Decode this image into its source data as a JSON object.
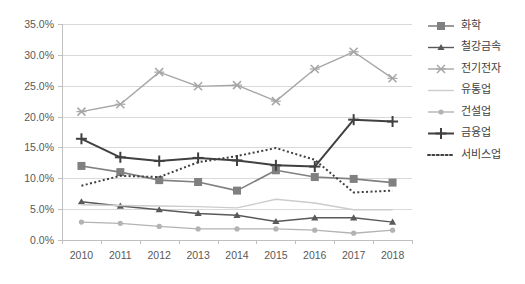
{
  "chart_data": {
    "type": "line",
    "title": "",
    "subtitle": "",
    "xlabel": "",
    "ylabel": "",
    "grid": true,
    "legend_position": "right",
    "categories": [
      "2010",
      "2011",
      "2012",
      "2013",
      "2014",
      "2015",
      "2016",
      "2017",
      "2018"
    ],
    "x": [
      2010,
      2011,
      2012,
      2013,
      2014,
      2015,
      2016,
      2017,
      2018
    ],
    "ylim": [
      0,
      35
    ],
    "ytick_labels": [
      "0.0%",
      "5.0%",
      "10.0%",
      "15.0%",
      "20.0%",
      "25.0%",
      "30.0%",
      "35.0%"
    ],
    "ytick_values": [
      0,
      5,
      10,
      15,
      20,
      25,
      30,
      35
    ],
    "yunit": "%",
    "series": [
      {
        "name": "화학",
        "marker": "square",
        "color": "#808080",
        "dash": "none",
        "width": 1.6,
        "values": [
          12.0,
          11.0,
          9.7,
          9.4,
          8.0,
          11.3,
          10.2,
          9.9,
          9.3
        ]
      },
      {
        "name": "철강금속",
        "marker": "triangle",
        "color": "#595959",
        "dash": "none",
        "width": 1.4,
        "values": [
          6.2,
          5.5,
          4.9,
          4.3,
          4.0,
          3.0,
          3.6,
          3.6,
          2.9
        ]
      },
      {
        "name": "전기전자",
        "marker": "x",
        "color": "#a6a6a6",
        "dash": "none",
        "width": 1.4,
        "values": [
          20.8,
          22.0,
          27.2,
          24.9,
          25.1,
          22.5,
          27.7,
          30.5,
          26.2
        ]
      },
      {
        "name": "유통업",
        "marker": "none",
        "color": "#cccccc",
        "dash": "none",
        "width": 1.4,
        "values": [
          5.7,
          5.6,
          5.5,
          5.4,
          5.2,
          6.6,
          6.0,
          4.9,
          4.9
        ]
      },
      {
        "name": "건설업",
        "marker": "dot",
        "color": "#b3b3b3",
        "dash": "none",
        "width": 1.4,
        "values": [
          2.9,
          2.7,
          2.2,
          1.8,
          1.8,
          1.8,
          1.6,
          1.1,
          1.6
        ]
      },
      {
        "name": "금융업",
        "marker": "plus",
        "color": "#404040",
        "dash": "none",
        "width": 2.0,
        "values": [
          16.4,
          13.4,
          12.8,
          13.3,
          12.9,
          12.1,
          11.9,
          19.5,
          19.2
        ]
      },
      {
        "name": "서비스업",
        "marker": "none",
        "color": "#404040",
        "dash": "dotted",
        "width": 2.0,
        "values": [
          8.8,
          10.4,
          10.2,
          12.6,
          13.6,
          14.9,
          13.0,
          7.7,
          8.0
        ]
      }
    ]
  },
  "legend": {
    "items": [
      {
        "label": "화학"
      },
      {
        "label": "철강금속"
      },
      {
        "label": "전기전자"
      },
      {
        "label": "유통업"
      },
      {
        "label": "건설업"
      },
      {
        "label": "금융업"
      },
      {
        "label": "서비스업"
      }
    ]
  },
  "colors": {
    "background": "#ffffff",
    "grid": "#d9d9d9",
    "axis": "#bfbfbf",
    "text": "#595959"
  }
}
